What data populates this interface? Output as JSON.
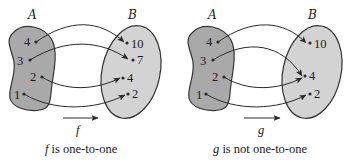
{
  "diagrams": [
    {
      "id": "f",
      "domain_label": "A",
      "codomain_label": "B",
      "function_name": "f",
      "caption_fn": "f",
      "caption_rest": " is one-to-one",
      "domain": [
        "4",
        "3",
        "2",
        "1"
      ],
      "codomain": [
        "10",
        "7",
        "4",
        "2"
      ],
      "mappings": [
        {
          "from": "4",
          "to": "10"
        },
        {
          "from": "3",
          "to": "7"
        },
        {
          "from": "2",
          "to": "4"
        },
        {
          "from": "1",
          "to": "2"
        }
      ]
    },
    {
      "id": "g",
      "domain_label": "A",
      "codomain_label": "B",
      "function_name": "g",
      "caption_fn": "g",
      "caption_rest": " is not one-to-one",
      "domain": [
        "4",
        "3",
        "2",
        "1"
      ],
      "codomain": [
        "10",
        "4",
        "2"
      ],
      "mappings": [
        {
          "from": "4",
          "to": "10"
        },
        {
          "from": "3",
          "to": "4"
        },
        {
          "from": "2",
          "to": "4"
        },
        {
          "from": "1",
          "to": "2"
        }
      ]
    }
  ],
  "colors": {
    "domain_fill": "#a9a9a9",
    "codomain_fill": "#d3d3d3",
    "stroke": "#333333"
  }
}
